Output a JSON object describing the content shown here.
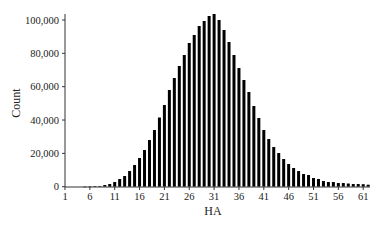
{
  "chart_data": {
    "type": "bar",
    "title": "",
    "xlabel": "HA",
    "ylabel": "Count",
    "ylim": [
      0,
      100000
    ],
    "xlim": [
      1,
      62
    ],
    "grid": false,
    "legend": null,
    "x_ticks": [
      1,
      6,
      11,
      16,
      21,
      26,
      31,
      36,
      41,
      46,
      51,
      56,
      61
    ],
    "y_ticks": [
      0,
      20000,
      40000,
      60000,
      80000,
      100000
    ],
    "y_tick_labels": [
      "0",
      "20,000",
      "40,000",
      "60,000",
      "80,000",
      "100,000"
    ],
    "categories": [
      1,
      2,
      3,
      4,
      5,
      6,
      7,
      8,
      9,
      10,
      11,
      12,
      13,
      14,
      15,
      16,
      17,
      18,
      19,
      20,
      21,
      22,
      23,
      24,
      25,
      26,
      27,
      28,
      29,
      30,
      31,
      32,
      33,
      34,
      35,
      36,
      37,
      38,
      39,
      40,
      41,
      42,
      43,
      44,
      45,
      46,
      47,
      48,
      49,
      50,
      51,
      52,
      53,
      54,
      55,
      56,
      57,
      58,
      59,
      60,
      61,
      62
    ],
    "values": [
      0,
      0,
      0,
      0,
      50,
      100,
      200,
      400,
      1000,
      1600,
      2800,
      4600,
      6400,
      9400,
      13000,
      17200,
      22000,
      28000,
      34000,
      41500,
      49000,
      58000,
      65200,
      72400,
      79000,
      86200,
      91000,
      96400,
      99400,
      102400,
      103600,
      100000,
      94000,
      86800,
      79000,
      71200,
      64000,
      56800,
      48400,
      41200,
      34000,
      28600,
      23800,
      20200,
      16600,
      13600,
      11200,
      9400,
      7600,
      7000,
      5200,
      4600,
      3400,
      2800,
      2800,
      2200,
      2200,
      1900,
      1600,
      1600,
      1500,
      1200
    ]
  },
  "axes": {
    "x_title": "HA",
    "y_title": "Count"
  }
}
